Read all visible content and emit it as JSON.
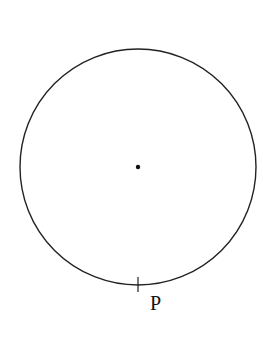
{
  "diagram": {
    "circle": {
      "cx": 138,
      "cy": 167,
      "r": 118,
      "stroke": "#222222"
    },
    "center_point": {
      "cx": 138,
      "cy": 167,
      "r": 2.2
    },
    "point_P": {
      "label": "P",
      "x": 138,
      "y": 285
    }
  }
}
